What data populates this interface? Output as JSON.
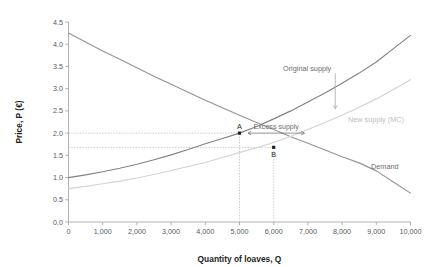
{
  "chart_data": {
    "type": "line",
    "title": "",
    "xlabel": "Quantity of loaves, Q",
    "ylabel": "Price, P (€)",
    "xlim": [
      0,
      10000
    ],
    "ylim": [
      0.0,
      4.5
    ],
    "grid": false,
    "legend_position": "inline-labels",
    "xticks": [
      "0",
      "1,000",
      "2,000",
      "3,000",
      "4,000",
      "5,000",
      "6,000",
      "7,000",
      "8,000",
      "9,000",
      "10,000"
    ],
    "xtick_values": [
      0,
      1000,
      2000,
      3000,
      4000,
      5000,
      6000,
      7000,
      8000,
      9000,
      10000
    ],
    "yticks": [
      "0.0",
      "0.5",
      "1.0",
      "1.5",
      "2.0",
      "2.5",
      "3.0",
      "3.5",
      "4.0",
      "4.5"
    ],
    "ytick_values": [
      0.0,
      0.5,
      1.0,
      1.5,
      2.0,
      2.5,
      3.0,
      3.5,
      4.0,
      4.5
    ],
    "series": [
      {
        "name": "Demand",
        "label": "Demand",
        "color": "#939598",
        "x": [
          0,
          500,
          1000,
          1500,
          2000,
          2500,
          3000,
          3500,
          4000,
          4500,
          5000,
          5500,
          6000,
          6500,
          7000,
          7500,
          8000,
          8500,
          9000,
          9500,
          10000
        ],
        "values": [
          4.25,
          4.05,
          3.85,
          3.66,
          3.47,
          3.28,
          3.1,
          2.92,
          2.74,
          2.57,
          2.4,
          2.24,
          2.08,
          1.92,
          1.77,
          1.62,
          1.47,
          1.33,
          1.15,
          0.9,
          0.65
        ]
      },
      {
        "name": "Original supply",
        "label": "Original supply",
        "color": "#808285",
        "x": [
          0,
          500,
          1000,
          1500,
          2000,
          2500,
          3000,
          3500,
          4000,
          4500,
          5000,
          5500,
          6000,
          6500,
          7000,
          7500,
          8000,
          8500,
          9000,
          9500,
          10000
        ],
        "values": [
          1.0,
          1.06,
          1.13,
          1.21,
          1.3,
          1.4,
          1.51,
          1.63,
          1.76,
          1.88,
          2.0,
          2.15,
          2.32,
          2.5,
          2.7,
          2.9,
          3.12,
          3.35,
          3.6,
          3.9,
          4.2
        ]
      },
      {
        "name": "New supply (MC)",
        "label": "New supply (MC)",
        "color": "#d1d3d4",
        "x": [
          0,
          500,
          1000,
          1500,
          2000,
          2500,
          3000,
          3500,
          4000,
          4500,
          5000,
          5500,
          6000,
          6500,
          7000,
          7500,
          8000,
          8500,
          9000,
          9500,
          10000
        ],
        "values": [
          0.75,
          0.8,
          0.86,
          0.92,
          0.99,
          1.07,
          1.16,
          1.25,
          1.34,
          1.45,
          1.56,
          1.67,
          1.79,
          1.93,
          2.08,
          2.24,
          2.4,
          2.58,
          2.77,
          2.98,
          3.2
        ]
      }
    ],
    "points": [
      {
        "label": "A",
        "x": 5000,
        "y": 2.0,
        "label_position": "above"
      },
      {
        "label": "B",
        "x": 6000,
        "y": 1.68,
        "label_position": "below"
      }
    ],
    "annotations": [
      {
        "label": "Excess supply",
        "type": "double-arrow",
        "y": 2.0,
        "x_start": 5250,
        "x_end": 6900
      },
      {
        "label": "",
        "type": "down-arrow",
        "x": 7800,
        "y_start": 3.35,
        "y_end": 2.55
      }
    ],
    "guide_lines": [
      {
        "type": "horizontal",
        "y": 2.0,
        "x_from": 0,
        "x_to": 5000
      },
      {
        "type": "horizontal",
        "y": 1.68,
        "x_from": 0,
        "x_to": 6000
      },
      {
        "type": "vertical",
        "x": 5000,
        "y_from": 0.0,
        "y_to": 2.0
      },
      {
        "type": "vertical",
        "x": 6000,
        "y_from": 0.0,
        "y_to": 1.68
      }
    ]
  },
  "labels": {
    "xlabel": "Quantity of loaves, Q",
    "ylabel": "Price, P (€)",
    "demand": "Demand",
    "original_supply": "Original supply",
    "new_supply": "New supply (MC)",
    "excess_supply": "Excess supply",
    "point_a": "A",
    "point_b": "B"
  },
  "colors": {
    "demand": "#939598",
    "original_supply": "#808285",
    "new_supply": "#d1d3d4",
    "axis": "#a7a9ac",
    "text": "#58595b",
    "title_text": "#231f20",
    "guide": "#bcbec0",
    "point": "#231f20",
    "background": "#ffffff"
  }
}
